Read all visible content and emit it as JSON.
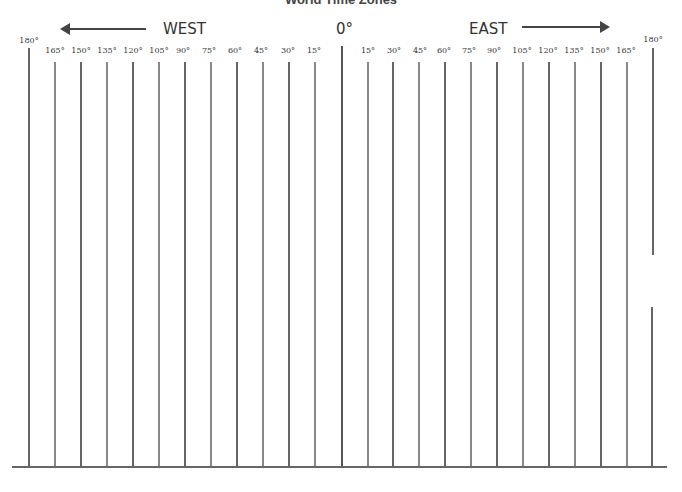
{
  "title": "World Time Zones",
  "west_label": "WEST",
  "east_label": "EAST",
  "zero_label": "0°",
  "labels": {
    "w180": "180°",
    "w165": "165°",
    "w150": "150°",
    "w135": "135°",
    "w120": "120°",
    "w105": "105°",
    "w90": "90°",
    "w75": "75°",
    "w60": "60°",
    "w45": "45°",
    "w30": "30°",
    "w15": "15°",
    "e15": "15°",
    "e30": "30°",
    "e45": "45°",
    "e60": "60°",
    "e75": "75°",
    "e90": "90°",
    "e105": "105°",
    "e120": "120°",
    "e135": "135°",
    "e150": "150°",
    "e165": "165°",
    "e180": "180°"
  },
  "meridians": [
    {
      "deg": 180,
      "dir": "W",
      "x": 29
    },
    {
      "deg": 165,
      "dir": "W",
      "x": 55
    },
    {
      "deg": 150,
      "dir": "W",
      "x": 81
    },
    {
      "deg": 135,
      "dir": "W",
      "x": 107
    },
    {
      "deg": 120,
      "dir": "W",
      "x": 133
    },
    {
      "deg": 105,
      "dir": "W",
      "x": 159
    },
    {
      "deg": 90,
      "dir": "W",
      "x": 185
    },
    {
      "deg": 75,
      "dir": "W",
      "x": 211
    },
    {
      "deg": 60,
      "dir": "W",
      "x": 237
    },
    {
      "deg": 45,
      "dir": "W",
      "x": 263
    },
    {
      "deg": 30,
      "dir": "W",
      "x": 289
    },
    {
      "deg": 15,
      "dir": "W",
      "x": 315
    },
    {
      "deg": 0,
      "dir": "",
      "x": 342
    },
    {
      "deg": 15,
      "dir": "E",
      "x": 368
    },
    {
      "deg": 30,
      "dir": "E",
      "x": 393
    },
    {
      "deg": 45,
      "dir": "E",
      "x": 419
    },
    {
      "deg": 60,
      "dir": "E",
      "x": 445
    },
    {
      "deg": 75,
      "dir": "E",
      "x": 471
    },
    {
      "deg": 90,
      "dir": "E",
      "x": 497
    },
    {
      "deg": 105,
      "dir": "E",
      "x": 523
    },
    {
      "deg": 120,
      "dir": "E",
      "x": 549
    },
    {
      "deg": 135,
      "dir": "E",
      "x": 575
    },
    {
      "deg": 150,
      "dir": "E",
      "x": 601
    },
    {
      "deg": 165,
      "dir": "E",
      "x": 627
    },
    {
      "deg": 180,
      "dir": "E",
      "x": 653
    }
  ]
}
